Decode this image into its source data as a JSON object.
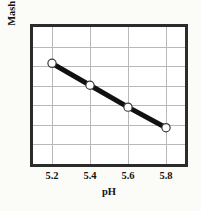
{
  "chart_data": {
    "type": "line",
    "title": "",
    "xlabel": "pH",
    "ylabel": "Mash Bed Permeability",
    "x": [
      5.2,
      5.4,
      5.6,
      5.8
    ],
    "xtick_labels": [
      "5.2",
      "5.4",
      "5.6",
      "5.8"
    ],
    "ytick_labels": [],
    "xlim": [
      5.1,
      5.9
    ],
    "ylim": [
      0,
      1
    ],
    "values": [
      0.735,
      0.575,
      0.415,
      0.265
    ],
    "series": [
      {
        "name": "Mash Bed Permeability",
        "values": [
          0.735,
          0.575,
          0.415,
          0.265
        ]
      }
    ],
    "grid": {
      "visible": true,
      "vertical_count": 4,
      "horizontal_count": 6,
      "color": "#b9b9b9"
    },
    "legend": {
      "visible": false,
      "position": "none"
    },
    "style": {
      "line_color": "#111111",
      "line_width": 5,
      "marker": "circle",
      "marker_face_color": "#ffffff",
      "marker_edge_color": "#3a3a3a",
      "frame_color": "#2b2b2b",
      "plot_background": "#ffffff",
      "page_background": "#fbfbf8",
      "text_color": "#141414"
    },
    "annotations": []
  }
}
